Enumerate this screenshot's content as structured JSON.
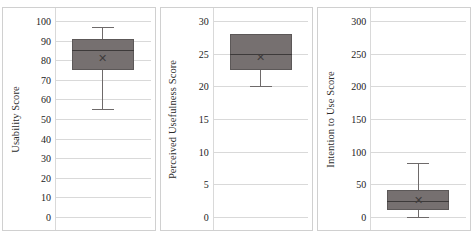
{
  "figure": {
    "background": "#ffffff",
    "panel_border_color": "#d0d0d0",
    "gridline_color": "#d9d9d9",
    "box_fill_color": "#767070",
    "box_line_color": "#5c5858",
    "mean_marker": "✕"
  },
  "chart_data": [
    {
      "type": "box",
      "title": "",
      "xlabel": "",
      "ylabel": "Usability Score",
      "ylim": [
        0,
        100
      ],
      "yticks": [
        0,
        10,
        20,
        30,
        40,
        50,
        60,
        70,
        80,
        90,
        100
      ],
      "ytick_labels": [
        "0",
        "10",
        "20",
        "30",
        "40",
        "50",
        "60",
        "70",
        "80",
        "90",
        "100"
      ],
      "grid": true,
      "legend": "none",
      "categories": [
        "Usability Score"
      ],
      "boxes": [
        {
          "name": "Usability Score",
          "min": 55,
          "q1": 75,
          "median": 85,
          "mean": 81,
          "q3": 91,
          "max": 97
        }
      ]
    },
    {
      "type": "box",
      "title": "",
      "xlabel": "",
      "ylabel": "Perceived Usefulness  Score",
      "ylim": [
        0,
        30
      ],
      "yticks": [
        0,
        5,
        10,
        15,
        20,
        25,
        30
      ],
      "ytick_labels": [
        "0",
        "5",
        "10",
        "15",
        "20",
        "25",
        "30"
      ],
      "grid": true,
      "legend": "none",
      "categories": [
        "Perceived Usefulness Score"
      ],
      "boxes": [
        {
          "name": "Perceived Usefulness Score",
          "min": 20,
          "q1": 22.5,
          "median": 25,
          "mean": 24.5,
          "q3": 28,
          "max": 28
        }
      ]
    },
    {
      "type": "box",
      "title": "",
      "xlabel": "",
      "ylabel": "Intention to Use Score",
      "ylim": [
        0,
        300
      ],
      "yticks": [
        0,
        50,
        100,
        150,
        200,
        250,
        300
      ],
      "ytick_labels": [
        "0",
        "50",
        "100",
        "150",
        "200",
        "250",
        "300"
      ],
      "grid": true,
      "legend": "none",
      "categories": [
        "Intention to Use Score"
      ],
      "boxes": [
        {
          "name": "Intention to Use Score",
          "min": 0,
          "q1": 10,
          "median": 25,
          "mean": 26,
          "q3": 42,
          "max": 83
        }
      ]
    }
  ]
}
